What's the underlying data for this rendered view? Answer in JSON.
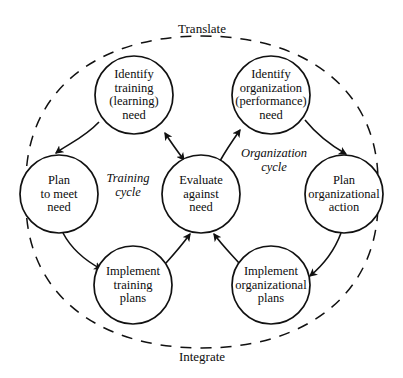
{
  "diagram": {
    "title_top": "Translate",
    "title_bottom": "Integrate",
    "stroke_color": "#111111",
    "fill_color": "#ffffff",
    "background_color": "#ffffff",
    "nodes": [
      {
        "id": "identify-training-need",
        "lines": [
          "Identify",
          "training",
          "(learning)",
          "need"
        ],
        "cx": 134,
        "cy": 95,
        "r": 39
      },
      {
        "id": "identify-organization-need",
        "lines": [
          "Identify",
          "organization",
          "(performance)",
          "need"
        ],
        "cx": 271,
        "cy": 95,
        "r": 39
      },
      {
        "id": "plan-to-meet-need",
        "lines": [
          "Plan",
          "to meet",
          "need"
        ],
        "cx": 59,
        "cy": 194,
        "r": 39
      },
      {
        "id": "evaluate-against-need",
        "lines": [
          "Evaluate",
          "against",
          "need"
        ],
        "cx": 201,
        "cy": 194,
        "r": 39
      },
      {
        "id": "plan-organizational-action",
        "lines": [
          "Plan",
          "organizational",
          "action"
        ],
        "cx": 344,
        "cy": 194,
        "r": 39
      },
      {
        "id": "implement-training-plans",
        "lines": [
          "Implement",
          "training",
          "plans"
        ],
        "cx": 133,
        "cy": 285,
        "r": 39
      },
      {
        "id": "implement-organizational-plans",
        "lines": [
          "Implement",
          "organizational",
          "plans"
        ],
        "cx": 271,
        "cy": 285,
        "r": 39
      }
    ],
    "cycle_labels": [
      {
        "id": "training-cycle",
        "lines": [
          "Training",
          "cycle"
        ],
        "cx": 128,
        "cy": 186
      },
      {
        "id": "organization-cycle",
        "lines": [
          "Organization",
          "cycle"
        ],
        "cx": 274,
        "cy": 161
      }
    ],
    "edge_labels": [
      {
        "id": "translate",
        "text": "Translate",
        "cx": 202,
        "cy": 29
      },
      {
        "id": "integrate",
        "text": "Integrate",
        "cx": 202,
        "cy": 357
      }
    ]
  }
}
